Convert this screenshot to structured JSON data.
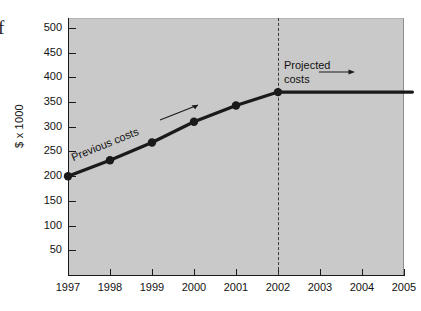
{
  "figure": {
    "edge_glyph": "f",
    "background_color": "#ffffff",
    "plot_background_color": "#c9c9c9",
    "series_color": "#1a1a1a",
    "divider_color": "#3a3a3a"
  },
  "chart_data": {
    "type": "line",
    "title": "",
    "xlabel": "",
    "ylabel": "$ x 1000",
    "categories": [
      "1997",
      "1998",
      "1999",
      "2000",
      "2001",
      "2002",
      "2003",
      "2004",
      "2005"
    ],
    "x": [
      1997,
      1998,
      1999,
      2000,
      2001,
      2002,
      2003,
      2004,
      2005
    ],
    "ylim": [
      0,
      520
    ],
    "xlim": [
      1997,
      2005
    ],
    "yticks": [
      50,
      100,
      150,
      200,
      250,
      300,
      350,
      400,
      450,
      500
    ],
    "ytick_labels": [
      "50",
      "100",
      "150",
      "200",
      "250",
      "300",
      "350",
      "400",
      "450",
      "500"
    ],
    "xtick_labels": [
      "1997",
      "1998",
      "1999",
      "2000",
      "2001",
      "2002",
      "2003",
      "2004",
      "2005"
    ],
    "grid": false,
    "legend": "none",
    "series": [
      {
        "name": "Previous costs",
        "x": [
          1997,
          1998,
          1999,
          2000,
          2001,
          2002
        ],
        "values": [
          200,
          232,
          268,
          310,
          343,
          370
        ],
        "markers": true
      },
      {
        "name": "Projected costs",
        "x": [
          2002,
          2005.2
        ],
        "values": [
          370,
          370
        ],
        "markers": false
      }
    ],
    "annotations": [
      {
        "text": "Previous costs",
        "kind": "rotated-label"
      },
      {
        "text": "Projected",
        "kind": "label-line1"
      },
      {
        "text": "costs",
        "kind": "label-line2"
      }
    ],
    "reference_line": {
      "x": 2002,
      "style": "dashed"
    }
  }
}
